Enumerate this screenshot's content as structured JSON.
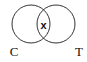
{
  "diagram": {
    "type": "venn",
    "sets": [
      {
        "label": "C",
        "cx": 31,
        "cy": 24,
        "r": 19
      },
      {
        "label": "T",
        "cx": 56,
        "cy": 24,
        "r": 19
      }
    ],
    "intersection_mark": "x",
    "stroke_color": "#333333"
  }
}
